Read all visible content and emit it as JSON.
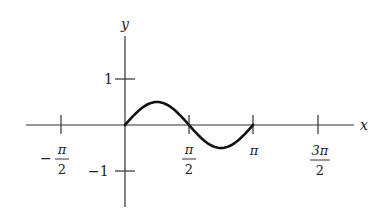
{
  "chart_data": {
    "type": "line",
    "title": "",
    "function": "y = (1/2) sin(2x)",
    "xlabel": "x",
    "ylabel": "y",
    "x_range": [
      0,
      3.14159
    ],
    "xlim": [
      -2.0,
      4.6
    ],
    "ylim": [
      -1.8,
      1.9
    ],
    "grid": false,
    "legend": null,
    "x_ticks": [
      {
        "value": -1.5708,
        "label_num": "π",
        "label_den": "2",
        "sign": "−"
      },
      {
        "value": 1.5708,
        "label_num": "π",
        "label_den": "2",
        "sign": ""
      },
      {
        "value": 3.14159,
        "label": "π"
      },
      {
        "value": 4.71239,
        "label_num": "3π",
        "label_den": "2",
        "sign": ""
      }
    ],
    "y_ticks": [
      {
        "value": 1,
        "label": "1"
      },
      {
        "value": -1,
        "label": "−1"
      }
    ],
    "x": [
      0,
      0.3927,
      0.7854,
      1.1781,
      1.5708,
      1.9635,
      2.3562,
      2.7489,
      3.14159
    ],
    "y": [
      0,
      0.354,
      0.5,
      0.354,
      0,
      -0.354,
      -0.5,
      -0.354,
      0
    ]
  },
  "labels": {
    "x_axis": "x",
    "y_axis": "y",
    "y_tick_pos": "1",
    "y_tick_neg": "−1",
    "x_tick_neg_half_pi_sign": "−",
    "x_tick_neg_half_pi_num": "π",
    "x_tick_neg_half_pi_den": "2",
    "x_tick_half_pi_num": "π",
    "x_tick_half_pi_den": "2",
    "x_tick_pi": "π",
    "x_tick_three_half_pi_num": "3π",
    "x_tick_three_half_pi_den": "2"
  },
  "colors": {
    "axis": "#333333",
    "curve": "#111111",
    "background": "#ffffff"
  }
}
